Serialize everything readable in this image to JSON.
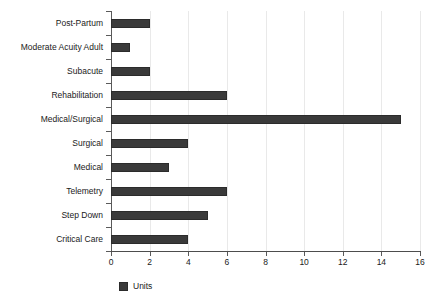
{
  "chart_data": {
    "type": "bar",
    "orientation": "horizontal",
    "title": "",
    "xlabel": "",
    "ylabel": "",
    "categories": [
      "Post-Partum",
      "Moderate Acuity Adult",
      "Subacute",
      "Rehabilitation",
      "Medical/Surgical",
      "Surgical",
      "Medical",
      "Telemetry",
      "Step Down",
      "Critical Care"
    ],
    "values": [
      2,
      1,
      2,
      6,
      15,
      4,
      3,
      6,
      5,
      4
    ],
    "series": [
      {
        "name": "Units",
        "values": [
          2,
          1,
          2,
          6,
          15,
          4,
          3,
          6,
          5,
          4
        ]
      }
    ],
    "xlim": [
      0,
      16
    ],
    "xticks": [
      0,
      2,
      4,
      6,
      8,
      10,
      12,
      14,
      16
    ],
    "xtick_labels": [
      "0",
      "2",
      "4",
      "6",
      "8",
      "10",
      "12",
      "14",
      "16"
    ],
    "grid": true,
    "grid_axis": "x",
    "legend": {
      "position": "bottom-left",
      "entries": [
        {
          "label": "Units",
          "color": "#3a3a3a"
        }
      ]
    },
    "colors": {
      "bar": "#3a3a3a",
      "bar_border": "#2b2b2b",
      "gridline": "#e9e9e9",
      "axis": "#4d4d4d",
      "text": "#1a1a1a",
      "background": "#ffffff"
    }
  }
}
